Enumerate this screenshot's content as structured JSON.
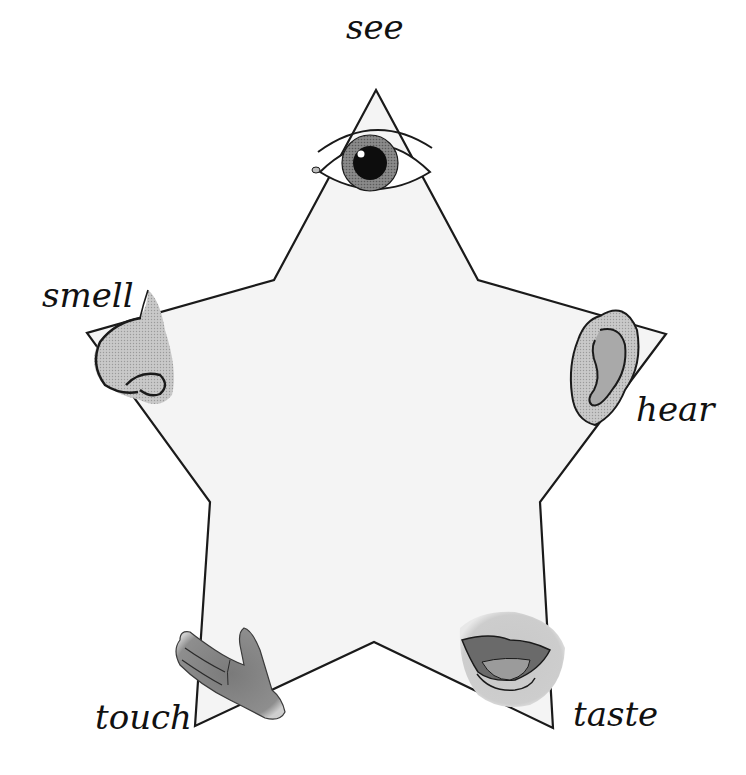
{
  "diagram": {
    "shape": "star",
    "colors": {
      "star_fill": "#f4f4f4",
      "star_stroke": "#1a1a1a",
      "feature_fill": "#b5b5b5",
      "feature_dark": "#6a6a6a",
      "iris": "#7a7a7a",
      "pupil": "#0d0d0d"
    },
    "points": [
      {
        "id": "top",
        "sense": "see",
        "icon": "eye-icon"
      },
      {
        "id": "left",
        "sense": "smell",
        "icon": "nose-icon"
      },
      {
        "id": "right",
        "sense": "hear",
        "icon": "ear-icon"
      },
      {
        "id": "bottom-left",
        "sense": "touch",
        "icon": "hand-icon"
      },
      {
        "id": "bottom-right",
        "sense": "taste",
        "icon": "mouth-icon"
      }
    ],
    "labels": {
      "see": "see",
      "smell": "smell",
      "hear": "hear",
      "touch": "touch",
      "taste": "taste"
    }
  }
}
